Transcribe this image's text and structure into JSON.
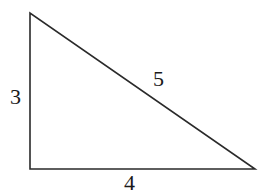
{
  "diagram": {
    "shape": "right-triangle",
    "stroke_color": "#2a2a2a",
    "vertices": {
      "top": [
        30,
        13
      ],
      "right_angle": [
        30,
        169
      ],
      "right": [
        255,
        169
      ]
    },
    "labels": {
      "vertical_leg": "3",
      "horizontal_leg": "4",
      "hypotenuse": "5"
    }
  }
}
